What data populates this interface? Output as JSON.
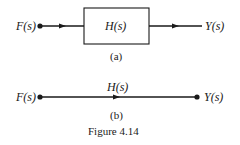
{
  "diagram_a": {
    "input_label": "F(s)",
    "block_label": "H(s)",
    "output_label": "Y(s)",
    "caption": "(a)"
  },
  "diagram_b": {
    "input_label": "F(s)",
    "branch_label": "H(s)",
    "output_label": "Y(s)",
    "caption": "(b)"
  },
  "figure_caption": "Figure 4.14",
  "colors": {
    "ink": "#1a1a1a",
    "background": "#ffffff"
  }
}
